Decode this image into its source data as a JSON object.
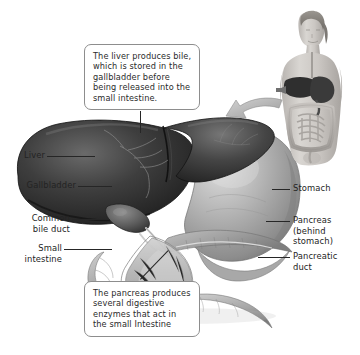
{
  "figure": {
    "style": "grayscale medical illustration",
    "background": "#ffffff"
  },
  "callouts": [
    {
      "id": "liver-callout",
      "text": "The liver produces bile, which is stored in the gallbladder before being released into the small intestine."
    },
    {
      "id": "pancreas-callout",
      "text": "The pancreas produces several digestive enzymes that act in the small Intestine"
    }
  ],
  "labels": {
    "liver": "Liver",
    "gallbladder": "Gallbladder",
    "common_bile_duct": "Common\nbile duct",
    "small_intestine": "Small\nintestine",
    "stomach": "Stomach",
    "pancreas": "Pancreas\n(behind\nstomach)",
    "pancreatic_duct": "Pancreatic\nduct"
  },
  "icons": {
    "pointer_arrow": "curved-arrow-icon",
    "body_inset": "human-torso-icon"
  },
  "colors": {
    "text": "#232323",
    "callout_border": "#8d8d8d",
    "leader_line": "#262626",
    "liver_dark": "#303030",
    "liver_mid": "#4a4a4a",
    "stomach_mid": "#a6a6a6",
    "stomach_light": "#c9c9c9",
    "duodenum": "#b4b4b4",
    "pancreas": "#9d9d9d",
    "inset_skin": "#c8c4c0",
    "arrow": "#b9b9b9"
  }
}
